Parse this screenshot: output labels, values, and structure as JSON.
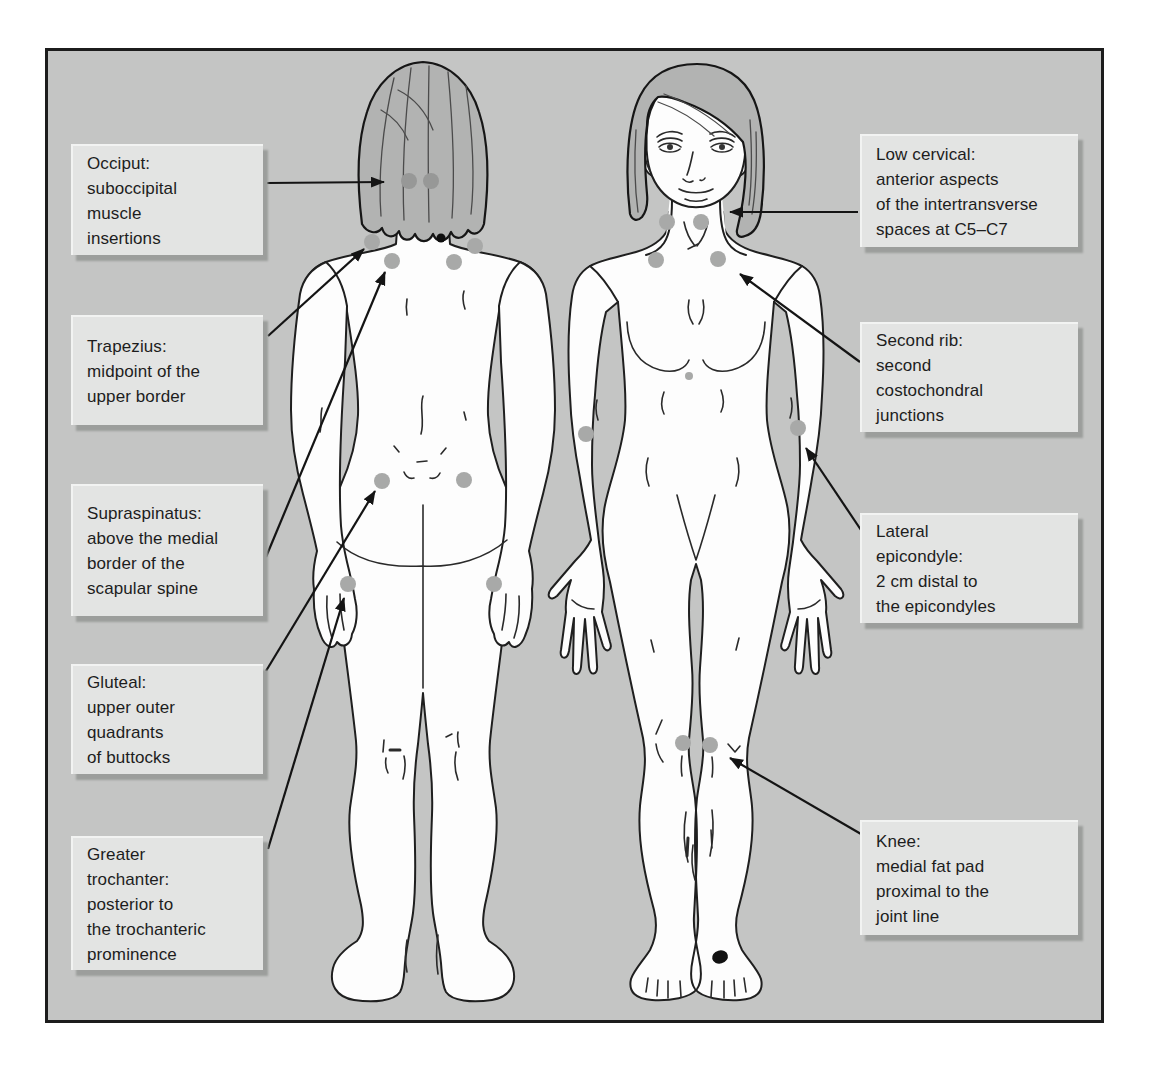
{
  "colors": {
    "panel_bg": "#c4c5c4",
    "panel_border": "#1c1c1c",
    "box_bg": "#e3e4e3",
    "dot": "#a8a9a8",
    "occiput_dot": "#979897",
    "line": "#141414"
  },
  "callouts": {
    "occiput": {
      "text": "Occiput:\nsuboccipital\nmuscle\ninsertions"
    },
    "trapezius": {
      "text": "Trapezius:\nmidpoint of the\nupper border"
    },
    "supraspinatus": {
      "text": "Supraspinatus:\nabove the medial\nborder of the\nscapular spine"
    },
    "gluteal": {
      "text": "Gluteal:\nupper outer\nquadrants\nof buttocks"
    },
    "trochanter": {
      "text": "Greater\ntrochanter:\nposterior to\nthe trochanteric\nprominence"
    },
    "low_cervical": {
      "text": "Low cervical:\nanterior aspects\nof the intertransverse\nspaces at C5–C7"
    },
    "second_rib": {
      "text": "Second rib:\nsecond\ncostochondral\njunctions"
    },
    "epicondyle": {
      "text": "Lateral\nepicondyle:\n2 cm distal to\nthe epicondyles"
    },
    "knee": {
      "text": "Knee:\nmedial fat pad\nproximal to the\njoint line"
    }
  },
  "tender_points": [
    {
      "name": "occiput-left",
      "view": "back",
      "x": 409,
      "y": 181,
      "r": 8,
      "fill": "#979897"
    },
    {
      "name": "occiput-right",
      "view": "back",
      "x": 431,
      "y": 181,
      "r": 8,
      "fill": "#979897"
    },
    {
      "name": "trapezius-left",
      "view": "back",
      "x": 372,
      "y": 242,
      "r": 8
    },
    {
      "name": "trapezius-right",
      "view": "back",
      "x": 475,
      "y": 246,
      "r": 8
    },
    {
      "name": "supraspinatus-left",
      "view": "back",
      "x": 392,
      "y": 261,
      "r": 8
    },
    {
      "name": "supraspinatus-right",
      "view": "back",
      "x": 454,
      "y": 262,
      "r": 8
    },
    {
      "name": "gluteal-left",
      "view": "back",
      "x": 382,
      "y": 481,
      "r": 8
    },
    {
      "name": "gluteal-right",
      "view": "back",
      "x": 464,
      "y": 480,
      "r": 8
    },
    {
      "name": "greater-trochanter-left",
      "view": "back",
      "x": 348,
      "y": 584,
      "r": 8
    },
    {
      "name": "greater-trochanter-right",
      "view": "back",
      "x": 494,
      "y": 584,
      "r": 8
    },
    {
      "name": "low-cervical-left",
      "view": "front",
      "x": 667,
      "y": 222,
      "r": 8
    },
    {
      "name": "low-cervical-right",
      "view": "front",
      "x": 701,
      "y": 222,
      "r": 8
    },
    {
      "name": "second-rib-left",
      "view": "front",
      "x": 656,
      "y": 260,
      "r": 8
    },
    {
      "name": "second-rib-right",
      "view": "front",
      "x": 718,
      "y": 259,
      "r": 8
    },
    {
      "name": "lateral-epicondyle-left",
      "view": "front",
      "x": 586,
      "y": 434,
      "r": 8
    },
    {
      "name": "lateral-epicondyle-right",
      "view": "front",
      "x": 798,
      "y": 428,
      "r": 8
    },
    {
      "name": "knee-left",
      "view": "front",
      "x": 683,
      "y": 743,
      "r": 8
    },
    {
      "name": "knee-right",
      "view": "front",
      "x": 710,
      "y": 745,
      "r": 8
    }
  ],
  "marks": [
    {
      "name": "c7-black-dot",
      "shape": "circle",
      "x": 441,
      "y": 238,
      "r": 4.5,
      "fill": "#0e0e0e"
    },
    {
      "name": "navel-dot",
      "shape": "circle",
      "x": 689,
      "y": 376,
      "r": 4,
      "fill": "#a8a9a8"
    },
    {
      "name": "ankle-black-mark",
      "shape": "ellipse",
      "x": 720,
      "y": 957,
      "rx": 8,
      "ry": 6.5,
      "rot": -15,
      "fill": "#111111"
    }
  ],
  "arrows": [
    {
      "name": "occiput-arrow",
      "x1": 267,
      "y1": 183,
      "x2": 384,
      "y2": 182
    },
    {
      "name": "trapezius-arrow",
      "x1": 268,
      "y1": 336,
      "x2": 364,
      "y2": 249
    },
    {
      "name": "supraspinatus-arrow",
      "x1": 266,
      "y1": 557,
      "x2": 385,
      "y2": 272
    },
    {
      "name": "gluteal-arrow",
      "x1": 266,
      "y1": 671,
      "x2": 375,
      "y2": 491
    },
    {
      "name": "greater-trochanter-arrow",
      "x1": 268,
      "y1": 849,
      "x2": 344,
      "y2": 598
    },
    {
      "name": "low-cervical-arrow",
      "x1": 858,
      "y1": 212,
      "x2": 730,
      "y2": 212
    },
    {
      "name": "second-rib-arrow",
      "x1": 860,
      "y1": 362,
      "x2": 740,
      "y2": 274
    },
    {
      "name": "lateral-epicondyle-arrow",
      "x1": 861,
      "y1": 530,
      "x2": 806,
      "y2": 448
    },
    {
      "name": "knee-arrow",
      "x1": 861,
      "y1": 834,
      "x2": 730,
      "y2": 758
    }
  ]
}
